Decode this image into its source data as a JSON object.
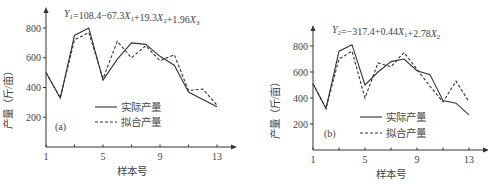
{
  "chart_data": [
    {
      "type": "line",
      "panel_label": "(a)",
      "title": "Y1=108.4−67.3X1+19.3X2+1.96X3",
      "equation": {
        "lhs": "Y",
        "lhs_sub": "1",
        "rhs": "=108.4−67.3X1+19.3X2+1.96X3"
      },
      "xlabel": "样本号",
      "ylabel": "产量（斤/亩）",
      "xticks": [
        1,
        5,
        9,
        13
      ],
      "yticks": [
        200,
        400,
        600,
        800
      ],
      "xlim": [
        1,
        13
      ],
      "ylim": [
        0,
        850
      ],
      "x": [
        1,
        2,
        3,
        4,
        5,
        6,
        7,
        8,
        9,
        10,
        11,
        12,
        13
      ],
      "series": [
        {
          "name": "实际产量",
          "style": "solid",
          "values": [
            500,
            330,
            750,
            800,
            450,
            590,
            700,
            690,
            610,
            550,
            370,
            320,
            270
          ]
        },
        {
          "name": "拟合产量",
          "style": "dashed",
          "values": [
            500,
            330,
            720,
            770,
            460,
            710,
            600,
            680,
            580,
            620,
            380,
            390,
            280
          ]
        }
      ],
      "legend_position": "center-left"
    },
    {
      "type": "line",
      "panel_label": "(b)",
      "title": "Y2=−317.4+0.44X1+2.78X2",
      "equation": {
        "lhs": "Y",
        "lhs_sub": "2",
        "rhs": "=−317.4+0.44X1+2.78X2"
      },
      "xlabel": "样本号",
      "ylabel": "产量（斤/亩）",
      "xticks": [
        1,
        5,
        9,
        13
      ],
      "yticks": [
        200,
        400,
        600,
        800
      ],
      "xlim": [
        1,
        13
      ],
      "ylim": [
        0,
        850
      ],
      "x": [
        1,
        2,
        3,
        4,
        5,
        6,
        7,
        8,
        9,
        10,
        11,
        12,
        13
      ],
      "series": [
        {
          "name": "实际产量",
          "style": "solid",
          "values": [
            510,
            320,
            760,
            810,
            500,
            600,
            680,
            700,
            610,
            580,
            380,
            360,
            270
          ]
        },
        {
          "name": "拟合产量",
          "style": "dashed",
          "values": [
            510,
            320,
            700,
            760,
            400,
            670,
            640,
            750,
            620,
            490,
            370,
            530,
            370
          ]
        }
      ],
      "legend_position": "center-left"
    }
  ]
}
